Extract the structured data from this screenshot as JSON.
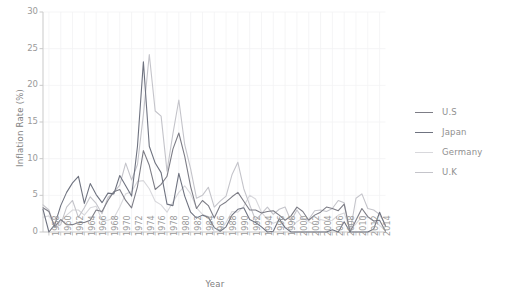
{
  "chart_data": {
    "type": "line",
    "title": "",
    "xlabel": "Year",
    "ylabel": "Inflation Rate (%)",
    "xlim": [
      1957,
      2015
    ],
    "ylim": [
      0,
      30
    ],
    "yticks": [
      0,
      5,
      10,
      15,
      20,
      25,
      30
    ],
    "xticks": [
      1958,
      1960,
      1962,
      1964,
      1966,
      1968,
      1970,
      1972,
      1974,
      1976,
      1978,
      1980,
      1982,
      1984,
      1986,
      1988,
      1990,
      1992,
      1994,
      1996,
      1998,
      2000,
      2002,
      2004,
      2006,
      2008,
      2010,
      2012,
      2014
    ],
    "grid": true,
    "legend_position": "right",
    "x": [
      1957,
      1958,
      1959,
      1960,
      1961,
      1962,
      1963,
      1964,
      1965,
      1966,
      1967,
      1968,
      1969,
      1970,
      1971,
      1972,
      1973,
      1974,
      1975,
      1976,
      1977,
      1978,
      1979,
      1980,
      1981,
      1982,
      1983,
      1984,
      1985,
      1986,
      1987,
      1988,
      1989,
      1990,
      1991,
      1992,
      1993,
      1994,
      1995,
      1996,
      1997,
      1998,
      1999,
      2000,
      2001,
      2002,
      2003,
      2004,
      2005,
      2006,
      2007,
      2008,
      2009,
      2010,
      2011,
      2012,
      2013,
      2014,
      2015
    ],
    "series": [
      {
        "name": "U.S",
        "color": "#7d7d86",
        "values": [
          3.3,
          2.8,
          0.7,
          1.7,
          1.0,
          1.0,
          1.3,
          1.3,
          1.6,
          3.0,
          2.8,
          4.3,
          5.5,
          5.8,
          4.3,
          3.3,
          6.2,
          11.1,
          9.1,
          5.8,
          6.5,
          7.6,
          11.3,
          13.5,
          10.3,
          6.2,
          3.2,
          4.3,
          3.6,
          1.9,
          3.6,
          4.1,
          4.8,
          5.4,
          4.2,
          3.0,
          3.0,
          2.6,
          2.8,
          2.9,
          2.3,
          1.6,
          2.2,
          3.4,
          2.8,
          1.6,
          2.3,
          2.7,
          3.4,
          3.2,
          2.9,
          3.8,
          -0.4,
          1.6,
          3.2,
          2.1,
          1.5,
          1.6,
          0.1
        ]
      },
      {
        "name": "Japan",
        "color": "#6f7380",
        "values": [
          3.1,
          -0.4,
          1.0,
          3.6,
          5.4,
          6.7,
          7.6,
          3.9,
          6.6,
          5.1,
          4.0,
          5.3,
          5.2,
          7.7,
          6.3,
          4.9,
          11.7,
          23.2,
          11.7,
          9.4,
          8.1,
          3.8,
          3.6,
          8.0,
          4.9,
          2.7,
          1.9,
          2.3,
          2.0,
          0.6,
          0.1,
          0.7,
          2.3,
          3.1,
          3.3,
          1.7,
          1.3,
          0.7,
          -0.1,
          0.1,
          1.8,
          0.6,
          -0.3,
          -0.7,
          -0.7,
          -0.9,
          -0.3,
          0.0,
          -0.3,
          0.3,
          0.0,
          1.4,
          -1.3,
          -0.7,
          -0.3,
          0.0,
          0.4,
          2.7,
          0.8
        ]
      },
      {
        "name": "Germany",
        "color": "#d8d8dc",
        "values": [
          2.0,
          2.2,
          1.0,
          1.4,
          2.3,
          3.0,
          3.0,
          2.3,
          3.3,
          3.5,
          1.6,
          1.6,
          1.9,
          3.4,
          5.2,
          5.5,
          6.9,
          7.0,
          5.9,
          4.2,
          3.7,
          2.7,
          4.1,
          5.4,
          6.3,
          5.2,
          3.3,
          2.4,
          2.1,
          -0.1,
          0.2,
          1.3,
          2.8,
          2.7,
          3.5,
          5.0,
          4.5,
          2.7,
          1.7,
          1.2,
          1.5,
          0.6,
          0.6,
          1.4,
          1.9,
          1.4,
          1.0,
          1.7,
          1.5,
          1.6,
          2.3,
          2.6,
          0.3,
          1.1,
          2.1,
          2.0,
          1.5,
          0.9,
          0.2
        ]
      },
      {
        "name": "U.K",
        "color": "#c4c4ca",
        "values": [
          3.7,
          3.0,
          0.6,
          1.0,
          3.4,
          4.3,
          2.0,
          3.3,
          4.8,
          3.9,
          2.5,
          4.7,
          5.4,
          6.4,
          9.4,
          7.1,
          9.2,
          16.0,
          24.2,
          16.5,
          15.8,
          8.3,
          13.4,
          18.0,
          11.9,
          8.6,
          4.6,
          5.0,
          6.1,
          3.4,
          4.2,
          4.9,
          7.8,
          9.5,
          5.9,
          3.7,
          1.6,
          2.5,
          3.4,
          2.4,
          3.1,
          3.4,
          1.5,
          3.0,
          1.8,
          1.7,
          2.9,
          3.0,
          2.8,
          3.2,
          4.3,
          4.0,
          -0.5,
          4.6,
          5.2,
          3.2,
          3.0,
          2.4,
          1.0
        ]
      }
    ]
  },
  "axes": {
    "ylabel": "Inflation Rate (%)",
    "xlabel": "Year",
    "ytick_labels": [
      "0",
      "5",
      "10",
      "15",
      "20",
      "25",
      "30"
    ],
    "xtick_labels": [
      "1958",
      "1960",
      "1962",
      "1964",
      "1966",
      "1968",
      "1970",
      "1972",
      "1974",
      "1976",
      "1978",
      "1980",
      "1982",
      "1984",
      "1986",
      "1988",
      "1990",
      "1992",
      "1994",
      "1996",
      "1998",
      "2000",
      "2002",
      "2004",
      "2006",
      "2008",
      "2010",
      "2012",
      "2014"
    ]
  },
  "legend": {
    "entries": [
      {
        "label": "U.S",
        "color": "#7d7d86"
      },
      {
        "label": "Japan",
        "color": "#6f7380"
      },
      {
        "label": "Germany",
        "color": "#d8d8dc"
      },
      {
        "label": "U.K",
        "color": "#c4c4ca"
      }
    ]
  },
  "style": {
    "background": "#ffffff",
    "axis_color": "#c9c9c9",
    "grid_color": "#f2f2f4",
    "tick_text_color": "#9a9a9a",
    "label_text_color": "#808080"
  }
}
